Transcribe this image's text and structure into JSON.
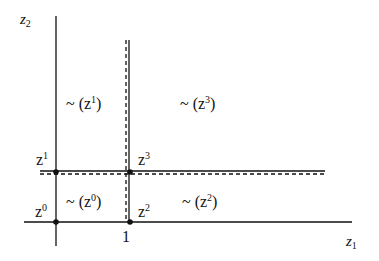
{
  "axes": {
    "y_label": {
      "base": "z",
      "sub": "2"
    },
    "x_label": {
      "base": "z",
      "sub": "1"
    },
    "x_tick": "1"
  },
  "points": [
    {
      "base": "z",
      "sup": "0"
    },
    {
      "base": "z",
      "sup": "1"
    },
    {
      "base": "z",
      "sup": "2"
    },
    {
      "base": "z",
      "sup": "3"
    }
  ],
  "regions": [
    {
      "prefix": "~ (z",
      "sup": "0",
      "suffix": ")"
    },
    {
      "prefix": "~ (z",
      "sup": "1",
      "suffix": ")"
    },
    {
      "prefix": "~ (z",
      "sup": "2",
      "suffix": ")"
    },
    {
      "prefix": "~ (z",
      "sup": "3",
      "suffix": ")"
    }
  ],
  "colors": {
    "line": "#111111",
    "background": "#ffffff"
  }
}
